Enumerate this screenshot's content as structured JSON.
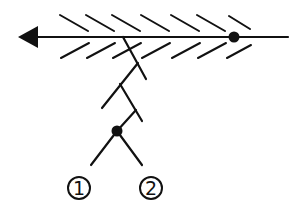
{
  "diagram": {
    "type": "symbol-schematic",
    "main_line": {
      "arrow": "left",
      "hatch_above": 7,
      "hatch_below": 7,
      "dot": true
    },
    "branch": {
      "zigzag_segments": 4,
      "split_dot": true
    },
    "labels": [
      {
        "id": "label-1",
        "text": "1",
        "glyph": "①"
      },
      {
        "id": "label-2",
        "text": "2",
        "glyph": "②"
      }
    ],
    "colors": {
      "ink": "#111111",
      "background": "#ffffff"
    }
  }
}
